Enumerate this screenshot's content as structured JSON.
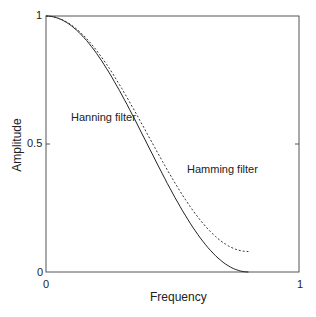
{
  "chart_data": {
    "type": "line",
    "title": "",
    "xlabel": "Frequency",
    "ylabel": "Amplitude",
    "xlim": [
      0,
      1
    ],
    "ylim": [
      0,
      1
    ],
    "xticks": [
      "0",
      "1"
    ],
    "yticks": [
      "0",
      "0.5",
      "1"
    ],
    "grid": false,
    "series": [
      {
        "name": "Hanning filter",
        "style": "solid",
        "x": [
          0,
          0.1,
          0.2,
          0.3,
          0.4,
          0.5,
          0.6,
          0.7,
          0.8
        ],
        "y": [
          1.0,
          0.962,
          0.854,
          0.691,
          0.5,
          0.309,
          0.146,
          0.038,
          0.0
        ]
      },
      {
        "name": "Hamming filter",
        "style": "dashed",
        "x": [
          0,
          0.1,
          0.2,
          0.3,
          0.4,
          0.5,
          0.6,
          0.7,
          0.8
        ],
        "y": [
          1.0,
          0.965,
          0.865,
          0.716,
          0.54,
          0.364,
          0.215,
          0.115,
          0.08
        ]
      }
    ],
    "annotations": [
      {
        "text": "Hanning filter",
        "x": 0.26,
        "y": 0.6
      },
      {
        "text": "Hamming filter",
        "x": 0.56,
        "y": 0.49
      }
    ]
  }
}
